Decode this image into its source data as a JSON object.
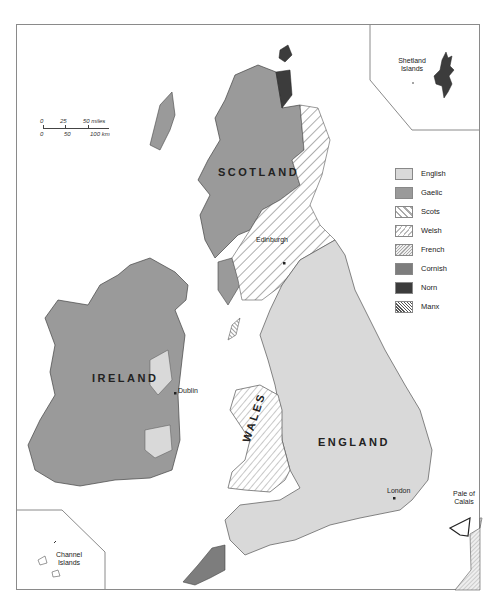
{
  "map": {
    "title": "Languages of the British Isles",
    "regions": {
      "scotland": "SCOTLAND",
      "ireland": "IRELAND",
      "england": "ENGLAND",
      "wales": "WALES"
    },
    "places": {
      "edinburgh": "Edinburgh",
      "dublin": "Dublin",
      "london": "London",
      "pale_of_calais": "Pale of Calais"
    },
    "insets": {
      "shetland": "Shetland Islands",
      "channel": "Channel Islands"
    },
    "scale": {
      "miles": [
        "0",
        "25",
        "50 miles"
      ],
      "km": [
        "0",
        "50",
        "100 km"
      ]
    },
    "legend": [
      {
        "label": "English",
        "fill": "#d9d9d9",
        "pattern": "solid"
      },
      {
        "label": "Gaelic",
        "fill": "#9a9a9a",
        "pattern": "solid"
      },
      {
        "label": "Scots",
        "fill": "#ffffff",
        "pattern": "wide-diagonal"
      },
      {
        "label": "Welsh",
        "fill": "#ffffff",
        "pattern": "diagonal"
      },
      {
        "label": "French",
        "fill": "#e8e8e8",
        "pattern": "fine-diagonal"
      },
      {
        "label": "Cornish",
        "fill": "#7d7d7d",
        "pattern": "solid"
      },
      {
        "label": "Norn",
        "fill": "#3c3c3c",
        "pattern": "solid"
      },
      {
        "label": "Manx",
        "fill": "#ffffff",
        "pattern": "dense-backdiagonal"
      }
    ]
  }
}
